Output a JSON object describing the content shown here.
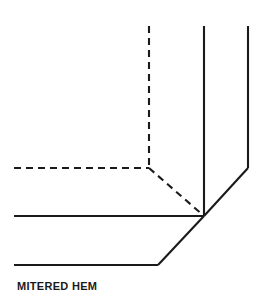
{
  "figure": {
    "caption": "MITERED HEM",
    "title": "MITERED HEM",
    "background_color": "#ffffff",
    "ink_color": "#1a1a1a",
    "width": 267,
    "height": 306,
    "stroke_width": 2.1,
    "dash_pattern": "7 5"
  },
  "geometry": {
    "solid_lines": [
      {
        "name": "outer-vertical-edge",
        "description": "right-hand outer vertical fabric edge",
        "points": "248,26 248,168"
      },
      {
        "name": "outer-diagonal-miter-edge",
        "description": "outer diagonal miter seam from right edge to corner point",
        "points": "248,168 204,216"
      },
      {
        "name": "inner-vertical-edge",
        "description": "inner vertical fold line of the side hem",
        "points": "204,26 204,216"
      },
      {
        "name": "upper-horizontal-edge",
        "description": "upper horizontal fold line of bottom hem meeting corner point",
        "points": "14,216 204,216"
      },
      {
        "name": "inner-diagonal-miter-edge",
        "description": "inner diagonal miter seam from corner point down-left",
        "points": "204,216 158,265"
      },
      {
        "name": "lower-horizontal-edge",
        "description": "lower horizontal finished hem edge",
        "points": "14,265 158,265"
      }
    ],
    "dashed_lines": [
      {
        "name": "hidden-vertical-foldline",
        "description": "hidden vertical fold line behind the hem",
        "points": "149,26 149,168"
      },
      {
        "name": "hidden-horizontal-foldline",
        "description": "hidden horizontal fold line behind the hem",
        "points": "14,168 149,168"
      },
      {
        "name": "hidden-diagonal-foldline",
        "description": "hidden diagonal fold line from inner corner to miter point",
        "points": "149,168 204,216"
      }
    ],
    "corner_point": {
      "name": "miter-corner-point",
      "x": 204,
      "y": 216
    }
  }
}
